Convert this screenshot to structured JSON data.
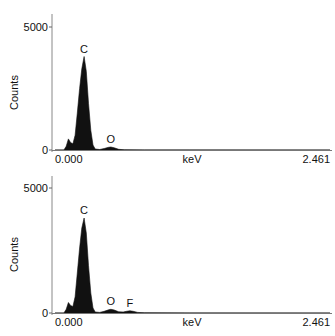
{
  "chart_data": [
    {
      "type": "area",
      "title": "",
      "xlabel": "keV",
      "ylabel": "Counts",
      "xlim": [
        0.0,
        2.461
      ],
      "ylim": [
        0,
        5000
      ],
      "x_tick_labels": [
        "0.000",
        "2.461"
      ],
      "y_tick_labels": [
        "0",
        "5000"
      ],
      "grid": false,
      "legend": null,
      "peak_labels": [
        {
          "label": "C",
          "x": 0.26,
          "y": 3800
        },
        {
          "label": "O",
          "x": 0.5,
          "y": 120
        }
      ],
      "series": [
        {
          "name": "spectrum 1",
          "points": [
            [
              0.0,
              0
            ],
            [
              0.08,
              0
            ],
            [
              0.1,
              150
            ],
            [
              0.12,
              450
            ],
            [
              0.14,
              300
            ],
            [
              0.16,
              250
            ],
            [
              0.18,
              600
            ],
            [
              0.2,
              1500
            ],
            [
              0.22,
              2500
            ],
            [
              0.24,
              3300
            ],
            [
              0.26,
              3800
            ],
            [
              0.28,
              3200
            ],
            [
              0.3,
              1900
            ],
            [
              0.32,
              800
            ],
            [
              0.34,
              200
            ],
            [
              0.36,
              40
            ],
            [
              0.4,
              20
            ],
            [
              0.44,
              60
            ],
            [
              0.48,
              110
            ],
            [
              0.5,
              120
            ],
            [
              0.53,
              90
            ],
            [
              0.57,
              30
            ],
            [
              0.62,
              10
            ],
            [
              0.8,
              5
            ],
            [
              1.2,
              3
            ],
            [
              2.461,
              0
            ]
          ]
        }
      ]
    },
    {
      "type": "area",
      "title": "",
      "xlabel": "keV",
      "ylabel": "Counts",
      "xlim": [
        0.0,
        2.461
      ],
      "ylim": [
        0,
        5000
      ],
      "x_tick_labels": [
        "0.000",
        "2.461"
      ],
      "y_tick_labels": [
        "0",
        "5000"
      ],
      "grid": false,
      "legend": null,
      "peak_labels": [
        {
          "label": "C",
          "x": 0.26,
          "y": 3800
        },
        {
          "label": "O",
          "x": 0.5,
          "y": 150
        },
        {
          "label": "F",
          "x": 0.67,
          "y": 90
        }
      ],
      "series": [
        {
          "name": "spectrum 2",
          "points": [
            [
              0.0,
              0
            ],
            [
              0.08,
              0
            ],
            [
              0.1,
              150
            ],
            [
              0.12,
              420
            ],
            [
              0.14,
              300
            ],
            [
              0.16,
              260
            ],
            [
              0.18,
              650
            ],
            [
              0.2,
              1600
            ],
            [
              0.22,
              2600
            ],
            [
              0.24,
              3400
            ],
            [
              0.26,
              3800
            ],
            [
              0.28,
              3200
            ],
            [
              0.3,
              1900
            ],
            [
              0.32,
              800
            ],
            [
              0.34,
              200
            ],
            [
              0.36,
              40
            ],
            [
              0.4,
              25
            ],
            [
              0.44,
              70
            ],
            [
              0.48,
              130
            ],
            [
              0.5,
              150
            ],
            [
              0.53,
              120
            ],
            [
              0.57,
              50
            ],
            [
              0.61,
              40
            ],
            [
              0.64,
              70
            ],
            [
              0.67,
              90
            ],
            [
              0.7,
              70
            ],
            [
              0.74,
              25
            ],
            [
              0.8,
              8
            ],
            [
              1.2,
              3
            ],
            [
              2.461,
              0
            ]
          ]
        }
      ]
    }
  ]
}
